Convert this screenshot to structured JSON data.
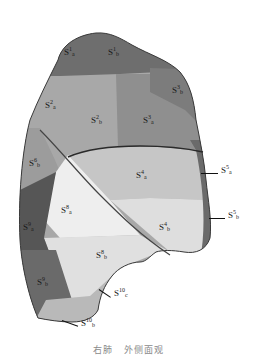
{
  "figure": {
    "title_parts": [
      "右肺",
      "外侧面观"
    ],
    "colors": {
      "outline": "#2a2a2a",
      "fissure": "#3a3a3a",
      "s1": "#6f6f6f",
      "s2": "#a8a8a8",
      "s3": "#8e8e8e",
      "s4": "#cfcfcf",
      "s5": "#7a7a7a",
      "s6": "#9a9a9a",
      "s8": "#e6e6e6",
      "s9": "#5a5a5a",
      "s10": "#b8b8b8"
    },
    "labels": [
      {
        "id": "S1a",
        "base": "S",
        "sup": "1",
        "sub": "a",
        "x": 64,
        "y": 50
      },
      {
        "id": "S1b",
        "base": "S",
        "sup": "1",
        "sub": "b",
        "x": 108,
        "y": 50
      },
      {
        "id": "S3b",
        "base": "S",
        "sup": "3",
        "sub": "b",
        "x": 172,
        "y": 88
      },
      {
        "id": "S2a",
        "base": "S",
        "sup": "2",
        "sub": "a",
        "x": 45,
        "y": 103
      },
      {
        "id": "S2b",
        "base": "S",
        "sup": "2",
        "sub": "b",
        "x": 91,
        "y": 118
      },
      {
        "id": "S3a",
        "base": "S",
        "sup": "3",
        "sub": "a",
        "x": 143,
        "y": 118
      },
      {
        "id": "S6b",
        "base": "S",
        "sup": "6",
        "sub": "b",
        "x": 29,
        "y": 161
      },
      {
        "id": "S4a",
        "base": "S",
        "sup": "4",
        "sub": "a",
        "x": 136,
        "y": 173
      },
      {
        "id": "S5a",
        "base": "S",
        "sup": "5",
        "sub": "a",
        "x": 221,
        "y": 168
      },
      {
        "id": "S8a",
        "base": "S",
        "sup": "8",
        "sub": "a",
        "x": 61,
        "y": 208
      },
      {
        "id": "S4b",
        "base": "S",
        "sup": "4",
        "sub": "b",
        "x": 159,
        "y": 225
      },
      {
        "id": "S5b",
        "base": "S",
        "sup": "5",
        "sub": "b",
        "x": 228,
        "y": 213
      },
      {
        "id": "S9a",
        "base": "S",
        "sup": "9",
        "sub": "a",
        "x": 23,
        "y": 225
      },
      {
        "id": "S8b",
        "base": "S",
        "sup": "8",
        "sub": "b",
        "x": 96,
        "y": 253
      },
      {
        "id": "S9b",
        "base": "S",
        "sup": "9",
        "sub": "b",
        "x": 37,
        "y": 280
      },
      {
        "id": "S10c",
        "base": "S",
        "sup": "10",
        "sub": "c",
        "x": 114,
        "y": 291
      },
      {
        "id": "S10b",
        "base": "S",
        "sup": "10",
        "sub": "b",
        "x": 81,
        "y": 321
      }
    ],
    "leader_lines": [
      {
        "to": "S5a",
        "x1": 201,
        "y1": 173,
        "x2": 218,
        "y2": 173
      },
      {
        "to": "S5b",
        "x1": 209,
        "y1": 218,
        "x2": 225,
        "y2": 218
      },
      {
        "to": "S10c",
        "x1": 99,
        "y1": 289,
        "x2": 111,
        "y2": 297
      },
      {
        "to": "S10b",
        "x1": 62,
        "y1": 320,
        "x2": 78,
        "y2": 326
      }
    ]
  }
}
